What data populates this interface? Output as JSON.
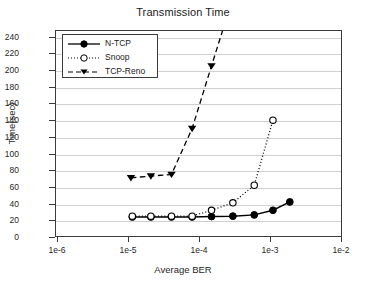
{
  "chart_data": {
    "type": "line",
    "title": "Transmission Time",
    "xlabel": "Average BER",
    "ylabel": "Time(sec)",
    "xscale": "log",
    "yscale": "linear",
    "xlim": [
      1e-06,
      0.01
    ],
    "ylim": [
      0,
      248
    ],
    "grid": true,
    "grid_axis": "y",
    "legend_position": "upper left",
    "xticks": [
      1e-06,
      1e-05,
      0.0001,
      0.001,
      0.01
    ],
    "xtick_labels": [
      "1e-6",
      "1e-5",
      "1e-4",
      "1e-3",
      "1e-2"
    ],
    "yticks": [
      0,
      20,
      40,
      60,
      80,
      100,
      120,
      140,
      160,
      180,
      200,
      220,
      240
    ],
    "ytick_labels": [
      "0",
      "20",
      "40",
      "60",
      "80",
      "100",
      "120",
      "140",
      "160",
      "180",
      "200",
      "220",
      "240"
    ],
    "series": [
      {
        "name": "N-TCP",
        "marker": "filled-circle",
        "linestyle": "solid",
        "color": "#000000",
        "x": [
          1.15e-05,
          2.1e-05,
          4.1e-05,
          8e-05,
          0.00015,
          0.0003,
          0.0006,
          0.0011,
          0.0019
        ],
        "y": [
          24,
          24,
          24,
          24,
          24.5,
          25,
          26.5,
          32,
          42
        ]
      },
      {
        "name": "Snoop",
        "marker": "open-circle",
        "linestyle": "dotted",
        "color": "#000000",
        "x": [
          1.15e-05,
          2.1e-05,
          4.1e-05,
          8e-05,
          0.00015,
          0.0003,
          0.0006,
          0.0011
        ],
        "y": [
          25,
          25,
          25,
          25,
          32,
          41,
          62,
          140
        ]
      },
      {
        "name": "TCP-Reno",
        "marker": "filled-triangle-down",
        "linestyle": "dashed",
        "color": "#000000",
        "x": [
          1.1e-05,
          2.1e-05,
          4.1e-05,
          8e-05,
          0.00015,
          0.00022
        ],
        "y": [
          71,
          73,
          75,
          130,
          205,
          250
        ]
      }
    ]
  },
  "legend": {
    "items": [
      {
        "label": "N-TCP"
      },
      {
        "label": "Snoop"
      },
      {
        "label": "TCP-Reno"
      }
    ]
  }
}
